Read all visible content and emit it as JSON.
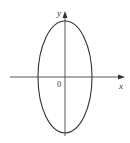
{
  "diagram": {
    "type": "ellipse-on-axes",
    "labels": {
      "x_axis": "x",
      "y_axis": "y",
      "origin": "0"
    },
    "ellipse": {
      "center": [
        65,
        77
      ],
      "rx": 27,
      "ry": 56,
      "stroke": "#333333"
    },
    "axes": {
      "color": "#444444",
      "x_range_px": [
        10,
        125
      ],
      "y_range_px": [
        12,
        136
      ]
    }
  }
}
